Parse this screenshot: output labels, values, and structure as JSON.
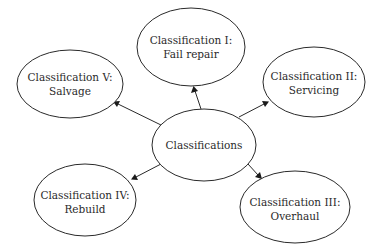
{
  "diagram": {
    "type": "hub-and-spoke",
    "center": {
      "id": "classifications",
      "label_lines": [
        "Classifications"
      ]
    },
    "nodes": [
      {
        "id": "class-1",
        "label_lines": [
          "Classification I:",
          "Fail repair"
        ]
      },
      {
        "id": "class-2",
        "label_lines": [
          "Classification II:",
          "Servicing"
        ]
      },
      {
        "id": "class-3",
        "label_lines": [
          "Classification III:",
          "Overhaul"
        ]
      },
      {
        "id": "class-4",
        "label_lines": [
          "Classification IV:",
          "Rebuild"
        ]
      },
      {
        "id": "class-5",
        "label_lines": [
          "Classification V:",
          "Salvage"
        ]
      }
    ],
    "edges": [
      {
        "from": "classifications",
        "to": "class-1",
        "directed": true
      },
      {
        "from": "classifications",
        "to": "class-2",
        "directed": true
      },
      {
        "from": "classifications",
        "to": "class-3",
        "directed": true
      },
      {
        "from": "classifications",
        "to": "class-4",
        "directed": true
      },
      {
        "from": "classifications",
        "to": "class-5",
        "directed": true
      }
    ]
  }
}
